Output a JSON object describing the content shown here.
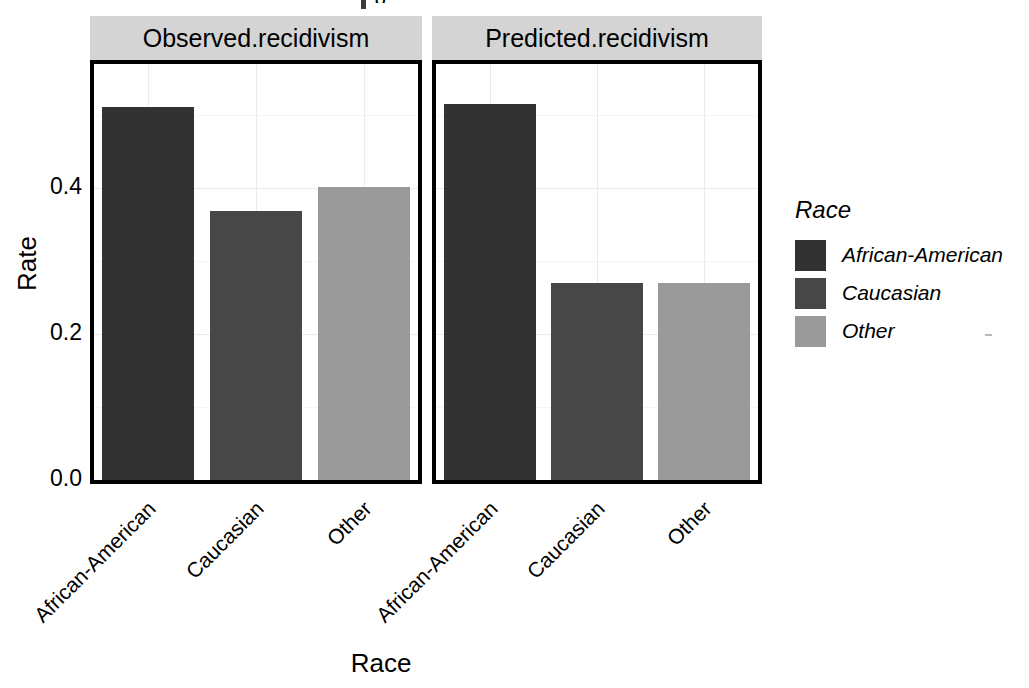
{
  "figure": {
    "clipped_top_title": "p",
    "axis_titles": {
      "x": "Race",
      "y": "Rate"
    }
  },
  "facets": [
    {
      "label": "Observed.recidivism"
    },
    {
      "label": "Predicted.recidivism"
    }
  ],
  "legend": {
    "title": "Race",
    "items": [
      {
        "label": "African-American",
        "color": "#323232"
      },
      {
        "label": "Caucasian",
        "color": "#474747"
      },
      {
        "label": "Other",
        "color": "#9a9a9a"
      }
    ]
  },
  "y_axis": {
    "ticks": [
      "0.0",
      "0.2",
      "0.4"
    ],
    "tick_values": [
      0.0,
      0.2,
      0.4
    ]
  },
  "x_axis": {
    "ticks": [
      "African-American",
      "Caucasian",
      "Other"
    ]
  },
  "chart_data": {
    "type": "bar",
    "title": "",
    "xlabel": "Race",
    "ylabel": "Rate",
    "ylim": [
      0,
      0.57
    ],
    "ytick_values": [
      0.0,
      0.2,
      0.4
    ],
    "ytick_labels": [
      "0.0",
      "0.2",
      "0.4"
    ],
    "grid": true,
    "grid_axis": "both",
    "legend_position": "right",
    "legend_title": "Race",
    "facet_variable": "measure",
    "facet_labels": [
      "Observed.recidivism",
      "Predicted.recidivism"
    ],
    "categories": [
      "African-American",
      "Caucasian",
      "Other"
    ],
    "colors": [
      "#323232",
      "#474747",
      "#9a9a9a"
    ],
    "panels": [
      {
        "facet": "Observed.recidivism",
        "categories": [
          "African-American",
          "Caucasian",
          "Other"
        ],
        "values": [
          0.511,
          0.369,
          0.401
        ]
      },
      {
        "facet": "Predicted.recidivism",
        "categories": [
          "African-American",
          "Caucasian",
          "Other"
        ],
        "values": [
          0.515,
          0.27,
          0.27
        ]
      }
    ],
    "series": [
      {
        "name": "Observed.recidivism",
        "values": [
          0.511,
          0.369,
          0.401
        ]
      },
      {
        "name": "Predicted.recidivism",
        "values": [
          0.515,
          0.27,
          0.27
        ]
      }
    ]
  }
}
